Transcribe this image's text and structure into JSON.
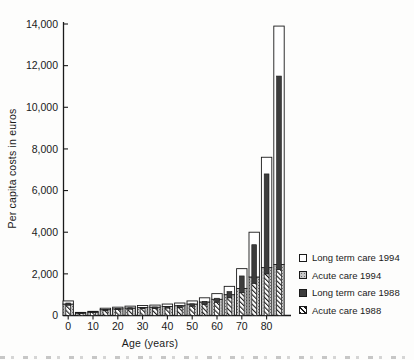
{
  "figure": {
    "ylabel": "Per capita costs in euros",
    "xlabel": "Age (years)"
  },
  "legend": [
    {
      "label": "Long term care 1994",
      "swatch": "white"
    },
    {
      "label": "Acute care 1994",
      "swatch": "dots"
    },
    {
      "label": "Long term care 1988",
      "swatch": "dark"
    },
    {
      "label": "Acute care 1988",
      "swatch": "hatch"
    }
  ],
  "chart_data": {
    "type": "bar",
    "title": "",
    "xlabel": "Age (years)",
    "ylabel": "Per capita costs in euros",
    "ylim": [
      0,
      14000
    ],
    "grid": false,
    "legend_position": "right-middle",
    "y_tick_labels": [
      "0",
      "2,000",
      "4,000",
      "6,000",
      "8,000",
      "10,000",
      "12,000",
      "14,000"
    ],
    "x_tick_labels": [
      "0",
      "10",
      "20",
      "30",
      "40",
      "50",
      "60",
      "70",
      "80"
    ],
    "categories": [
      "0-4",
      "5-9",
      "10-14",
      "15-19",
      "20-24",
      "25-29",
      "30-34",
      "35-39",
      "40-44",
      "45-49",
      "50-54",
      "55-59",
      "60-64",
      "65-69",
      "70-74",
      "75-79",
      "80-84",
      "85+"
    ],
    "layout_note": "two stacked bars per age group, all values estimated from gridlines: wide outlined bar = 1994 (Acute care 1994 bottom segment, Long term care 1994 top segment); narrow centered front bar = 1988 (Acute care 1988 bottom segment, Long term care 1988 top segment)",
    "series": [
      {
        "name": "Acute care 1994",
        "bar": "1994",
        "stack_order": "bottom",
        "pattern": "dots",
        "values": [
          550,
          120,
          160,
          280,
          320,
          360,
          380,
          400,
          430,
          470,
          550,
          650,
          780,
          1000,
          1300,
          1850,
          2300,
          2450
        ]
      },
      {
        "name": "Long term care 1994",
        "bar": "1994",
        "stack_order": "top",
        "pattern": "white",
        "values": [
          150,
          30,
          40,
          70,
          80,
          90,
          100,
          100,
          120,
          130,
          150,
          200,
          270,
          400,
          950,
          2150,
          5300,
          11450
        ]
      },
      {
        "name": "Acute care 1988",
        "bar": "1988",
        "stack_order": "bottom",
        "pattern": "hatch",
        "values": [
          500,
          100,
          140,
          240,
          280,
          310,
          330,
          340,
          360,
          390,
          450,
          540,
          640,
          850,
          1100,
          1550,
          2000,
          2200
        ]
      },
      {
        "name": "Long term care 1988",
        "bar": "1988",
        "stack_order": "top",
        "pattern": "dark",
        "values": [
          100,
          20,
          20,
          40,
          50,
          60,
          60,
          70,
          80,
          90,
          110,
          140,
          190,
          300,
          800,
          1850,
          4800,
          9300
        ]
      }
    ],
    "totals_1994": [
      700,
      150,
      200,
      350,
      400,
      450,
      480,
      500,
      550,
      600,
      700,
      850,
      1050,
      1400,
      2250,
      4000,
      7600,
      13900
    ],
    "totals_1988": [
      600,
      120,
      160,
      280,
      330,
      370,
      390,
      410,
      440,
      480,
      560,
      680,
      830,
      1150,
      1900,
      3400,
      6800,
      11500
    ]
  },
  "colors": {
    "axis": "#1a1a1a",
    "bar_outline": "#1a1a1a",
    "ltc_1994_fill": "#ffffff",
    "acute_1994_fill": "#c9c9c9",
    "ltc_1988_fill": "#3c3c3c",
    "acute_1988_fill": "#ffffff"
  }
}
